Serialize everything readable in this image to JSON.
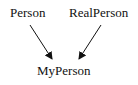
{
  "diagram": {
    "nodes": [
      {
        "id": "person",
        "label": "Person"
      },
      {
        "id": "realperson",
        "label": "RealPerson"
      },
      {
        "id": "myperson",
        "label": "MyPerson"
      }
    ],
    "edges": [
      {
        "from": "person",
        "to": "myperson"
      },
      {
        "from": "realperson",
        "to": "myperson"
      }
    ]
  }
}
